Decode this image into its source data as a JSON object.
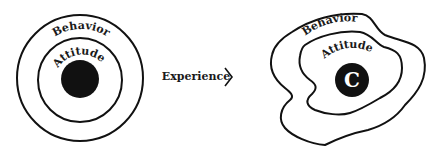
{
  "left_diagram": {
    "outer_label": "Behavior",
    "inner_label": "Attitude",
    "core_label": ""
  },
  "arrow": {
    "label": "Experience",
    "glyph": "chevron-right"
  },
  "right_diagram": {
    "outer_label": "Behavior",
    "inner_label": "Attitude",
    "core_label": "C"
  },
  "colors": {
    "line": "#111111",
    "core": "#111111",
    "background": "#ffffff"
  }
}
